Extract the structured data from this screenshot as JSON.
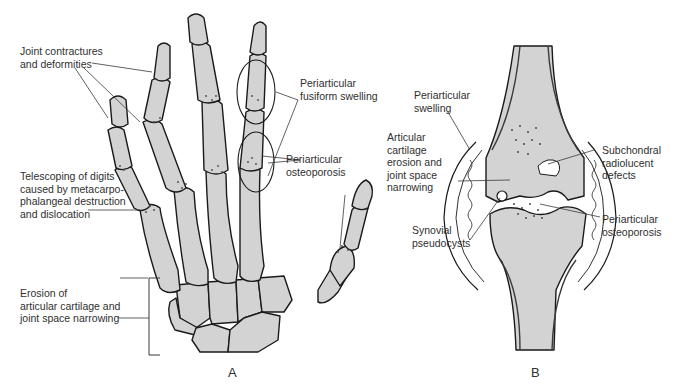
{
  "figure": {
    "panels": [
      {
        "id": "A",
        "letter": "A",
        "subject": "hand-skeleton",
        "labels": {
          "joint_contractures_l1": "Joint contractures",
          "joint_contractures_l2": "and deformities",
          "fusiform_l1": "Periarticular",
          "fusiform_l2": "fusiform swelling",
          "osteoporosis_l1": "Periarticular",
          "osteoporosis_l2": "osteoporosis",
          "telescoping_l1": "Telescoping of digits",
          "telescoping_l2": "caused by metacarpo-",
          "telescoping_l3": "phalangeal destruction",
          "telescoping_l4": "and dislocation",
          "erosion_l1": "Erosion of",
          "erosion_l2": "articular cartilage and",
          "erosion_l3": "joint space narrowing"
        }
      },
      {
        "id": "B",
        "letter": "B",
        "subject": "joint-cross-section",
        "labels": {
          "swelling_l1": "Periarticular",
          "swelling_l2": "swelling",
          "cartilage_l1": "Articular",
          "cartilage_l2": "cartilage",
          "cartilage_l3": "erosion and",
          "cartilage_l4": "joint space",
          "cartilage_l5": "narrowing",
          "pseudocysts_l1": "Synovial",
          "pseudocysts_l2": "pseudocysts",
          "subchondral_l1": "Subchondral",
          "subchondral_l2": "radiolucent",
          "subchondral_l3": "defects",
          "osteoporosis_l1": "Periarticular",
          "osteoporosis_l2": "osteoporosis"
        }
      }
    ],
    "colors": {
      "bone_fill": "#d3d3d3",
      "outline": "#1a1a1a",
      "text": "#2f2f2f",
      "background": "#ffffff"
    }
  }
}
